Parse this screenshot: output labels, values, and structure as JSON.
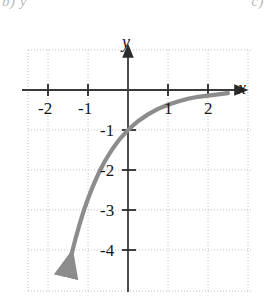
{
  "page": {
    "top_fragment_left": "b) y",
    "top_fragment_right": "c)"
  },
  "chart_data": {
    "type": "line",
    "title": "",
    "subtitle": "",
    "xlabel": "x",
    "ylabel": "y",
    "xlim": [
      -2.85,
      3.0
    ],
    "ylim": [
      -5.0,
      1.0
    ],
    "grid": true,
    "grid_style": "dotted",
    "grid_step_x": 1,
    "grid_step_y": 1,
    "legend": "none",
    "x_tick_labels": [
      "-2",
      "-1",
      "1",
      "2"
    ],
    "x_tick_values": [
      -2,
      -1,
      1,
      2
    ],
    "y_tick_labels": [
      "-1",
      "-2",
      "-3",
      "-4"
    ],
    "y_tick_values": [
      -1,
      -2,
      -3,
      -4
    ],
    "annotations": [
      "curve has horizontal asymptote at y = 0",
      "y-intercept at (0, -1)",
      "arrowhead on lower-left end of curve",
      "arrowheads on positive x-axis and positive y-axis"
    ],
    "series": [
      {
        "name": "y = -e^(-x)",
        "equation": "y = -e^{-x}",
        "color": "#8c8c8c",
        "line_width": 4,
        "arrow_start": true,
        "arrow_end": false,
        "x": [
          -1.5,
          -1.4,
          -1.3,
          -1.2,
          -1.1,
          -1.0,
          -0.9,
          -0.8,
          -0.7,
          -0.6,
          -0.5,
          -0.4,
          -0.3,
          -0.2,
          -0.1,
          0.0,
          0.25,
          0.5,
          0.75,
          1.0,
          1.25,
          1.5,
          1.75,
          2.0,
          2.25,
          2.5
        ],
        "y": [
          -4.48,
          -4.06,
          -3.67,
          -3.32,
          -3.0,
          -2.72,
          -2.46,
          -2.23,
          -2.01,
          -1.82,
          -1.65,
          -1.49,
          -1.35,
          -1.22,
          -1.11,
          -1.0,
          -0.78,
          -0.61,
          -0.47,
          -0.37,
          -0.29,
          -0.22,
          -0.17,
          -0.14,
          -0.11,
          -0.08
        ]
      }
    ]
  },
  "axes": {
    "x_axis_label": "x",
    "y_axis_label": "y"
  }
}
